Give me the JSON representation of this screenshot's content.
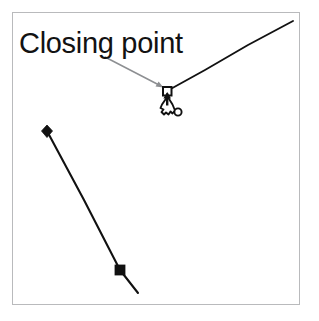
{
  "figure": {
    "type": "vector-path-editing-illustration",
    "background_color": "#ffffff",
    "frame": {
      "name": "canvas-frame",
      "border_color": "#b9babc",
      "x": 12,
      "y": 12,
      "width": 288,
      "height": 293
    },
    "callout": {
      "label": "Closing point",
      "text_color": "#121212",
      "leader_line_color": "#8d8f92",
      "leader_from": [
        105,
        57
      ],
      "leader_to": [
        163,
        87
      ]
    },
    "anchor_point": {
      "name": "closing-anchor-point",
      "shape": "hollow-square",
      "stroke_color": "#111111",
      "fill_color": "#ffffff",
      "x": 167,
      "y": 91,
      "size": 8
    },
    "paths": [
      {
        "name": "upper-right-path-segment",
        "stroke_color": "#111111",
        "points": [
          [
            167,
            91
          ],
          [
            205,
            70
          ],
          [
            248,
            45
          ],
          [
            293,
            21
          ]
        ]
      },
      {
        "name": "lower-left-path-segment",
        "stroke_color": "#111111",
        "points": [
          [
            47,
            131
          ],
          [
            84,
            200
          ],
          [
            120,
            270
          ],
          [
            138,
            293
          ]
        ]
      }
    ],
    "markers": [
      {
        "name": "path-start-diamond-marker",
        "shape": "filled-diamond",
        "color": "#111111",
        "x": 47,
        "y": 131,
        "size": 9
      },
      {
        "name": "path-selected-square-marker",
        "shape": "filled-square",
        "color": "#111111",
        "x": 120,
        "y": 270,
        "size": 10
      }
    ],
    "cursor": {
      "name": "pen-tool-cursor",
      "tool": "pen-tool",
      "fill_color": "#ffffff",
      "stroke_color": "#111111",
      "x": 164,
      "y": 98,
      "close_path_indicator": {
        "name": "close-path-circle-indicator",
        "shape": "hollow-circle",
        "x": 178,
        "y": 112,
        "radius": 3.5,
        "stroke_color": "#111111"
      }
    }
  }
}
